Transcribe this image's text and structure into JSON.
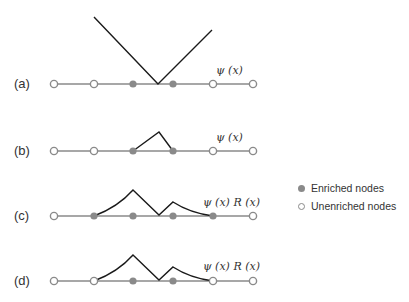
{
  "panels": [
    {
      "label": "(a)",
      "function_label": "ψ (x)",
      "y": 84,
      "nodes": [
        "open",
        "open",
        "filled",
        "filled",
        "open",
        "open"
      ],
      "curve": "M94,17 L158,84 L212,30"
    },
    {
      "label": "(b)",
      "function_label": "ψ (x)",
      "y": 151,
      "nodes": [
        "open",
        "open",
        "filled",
        "filled",
        "open",
        "open"
      ],
      "curve": "M133,151 L159,132 L173,151"
    },
    {
      "label": "(c)",
      "function_label": "ψ (x) R (x)",
      "y": 216,
      "nodes": [
        "open",
        "filled",
        "filled",
        "filled",
        "filled",
        "open"
      ],
      "curve": "M94,216 Q118,207 133,190 L159,215 L173,202 Q190,213 213,216"
    },
    {
      "label": "(d)",
      "function_label": "ψ (x) R (x)",
      "y": 281,
      "nodes": [
        "open",
        "open",
        "filled",
        "filled",
        "open",
        "open"
      ],
      "curve": "M94,281 Q118,272 133,255 L159,280 L173,267 Q190,278 213,281"
    }
  ],
  "node_x": [
    54,
    94,
    133,
    173,
    213,
    253
  ],
  "colors": {
    "axis": "#8a8a8a",
    "curve": "#1a1a1a",
    "node": "#8a8a8a"
  },
  "legend": {
    "enriched": "Enriched nodes",
    "unenriched": "Unenriched nodes"
  }
}
